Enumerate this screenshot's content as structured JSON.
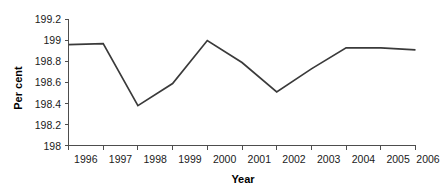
{
  "chart_data": {
    "type": "line",
    "title": "",
    "xlabel": "Year",
    "ylabel": "Per cent",
    "categories": [
      "1996",
      "1997",
      "1998",
      "1999",
      "2000",
      "2001",
      "2002",
      "2003",
      "2004",
      "2005",
      "2006"
    ],
    "x": [
      1996,
      1997,
      1998,
      1999,
      2000,
      2001,
      2002,
      2003,
      2004,
      2005,
      2006
    ],
    "values": [
      198.96,
      198.97,
      198.38,
      198.59,
      199.0,
      198.79,
      198.51,
      198.73,
      198.93,
      198.93,
      198.91
    ],
    "series": [
      {
        "name": "Per cent",
        "values": [
          198.96,
          198.97,
          198.38,
          198.59,
          199.0,
          198.79,
          198.51,
          198.73,
          198.93,
          198.93,
          198.91
        ],
        "color": "#3a3a3a"
      }
    ],
    "ylim": [
      198,
      199.2
    ],
    "yticks": [
      198,
      198.2,
      198.4,
      198.6,
      198.8,
      199,
      199.2
    ],
    "ytick_labels": [
      "198",
      "198.2",
      "198.4",
      "198.6",
      "198.8",
      "199",
      "199.2"
    ],
    "xtick_labels": [
      "1996",
      "1997",
      "1998",
      "1999",
      "2000",
      "2001",
      "2002",
      "2003",
      "2004",
      "2005",
      "2006"
    ],
    "grid": false,
    "legend": "none",
    "line_color": "#3a3a3a",
    "axis_color": "#4d4d4d",
    "background": "#ffffff"
  }
}
